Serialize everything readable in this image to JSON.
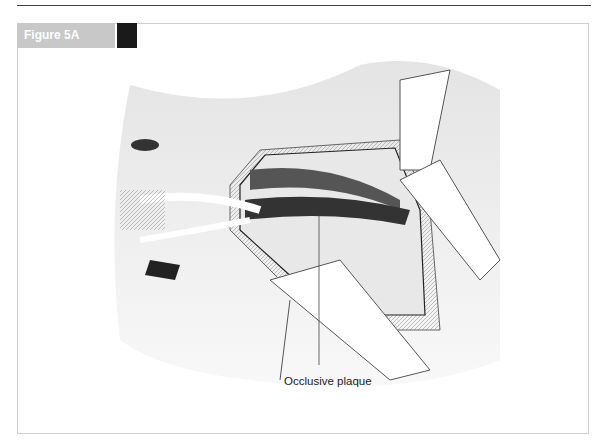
{
  "figure": {
    "label": "Figure 5A",
    "callouts": [
      {
        "text": "Occlusive plaque"
      }
    ],
    "illustration": "Surgical illustration: open incision with retractors exposing an artery; annotated occlusive plaque"
  },
  "colors": {
    "label_bg": "#c8c8c8",
    "label_accent": "#1a1a1a",
    "frame_border": "#cfcfcf"
  }
}
